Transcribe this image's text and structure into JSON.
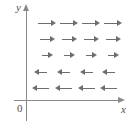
{
  "figure": {
    "kind": "vector-field-diagram",
    "background_color": "#ffffff",
    "axis_color": "#8a8a8a",
    "arrow_color": "#6e6e6e",
    "label_color": "#4d4d4d"
  },
  "axes": {
    "y_label": "y",
    "x_label": "x",
    "origin_label": "0",
    "y_axis": {
      "x": 26,
      "top": 4,
      "bottom": 121
    },
    "x_axis": {
      "y": 100,
      "left": 14,
      "right": 125
    }
  },
  "chart_data": {
    "type": "scatter",
    "title": "",
    "xlabel": "x",
    "ylabel": "y",
    "grid": false,
    "legend": "none",
    "rows": [
      {
        "row_index": 1,
        "y": 23,
        "direction": "right",
        "length": 18,
        "arrows": [
          {
            "x": 38,
            "y": 23,
            "direction": "right",
            "length": 18
          },
          {
            "x": 60,
            "y": 23,
            "direction": "right",
            "length": 18
          },
          {
            "x": 82,
            "y": 23,
            "direction": "right",
            "length": 18
          },
          {
            "x": 104,
            "y": 23,
            "direction": "right",
            "length": 18
          }
        ]
      },
      {
        "row_index": 2,
        "y": 39,
        "direction": "right",
        "length": 15,
        "arrows": [
          {
            "x": 40,
            "y": 39,
            "direction": "right",
            "length": 15
          },
          {
            "x": 62,
            "y": 39,
            "direction": "right",
            "length": 15
          },
          {
            "x": 84,
            "y": 39,
            "direction": "right",
            "length": 15
          },
          {
            "x": 106,
            "y": 39,
            "direction": "right",
            "length": 15
          }
        ]
      },
      {
        "row_index": 3,
        "y": 55,
        "direction": "right",
        "length": 11,
        "arrows": [
          {
            "x": 42,
            "y": 55,
            "direction": "right",
            "length": 11
          },
          {
            "x": 64,
            "y": 55,
            "direction": "right",
            "length": 11
          },
          {
            "x": 86,
            "y": 55,
            "direction": "right",
            "length": 11
          },
          {
            "x": 108,
            "y": 55,
            "direction": "right",
            "length": 11
          }
        ]
      },
      {
        "row_index": 4,
        "y": 72,
        "direction": "left",
        "length": 13,
        "arrows": [
          {
            "x": 34,
            "y": 72,
            "direction": "left",
            "length": 13
          },
          {
            "x": 57,
            "y": 72,
            "direction": "left",
            "length": 13
          },
          {
            "x": 80,
            "y": 72,
            "direction": "left",
            "length": 13
          },
          {
            "x": 102,
            "y": 72,
            "direction": "left",
            "length": 13
          }
        ]
      },
      {
        "row_index": 5,
        "y": 88,
        "direction": "left",
        "length": 17,
        "arrows": [
          {
            "x": 32,
            "y": 88,
            "direction": "left",
            "length": 17
          },
          {
            "x": 55,
            "y": 88,
            "direction": "left",
            "length": 17
          },
          {
            "x": 78,
            "y": 88,
            "direction": "left",
            "length": 17
          },
          {
            "x": 100,
            "y": 88,
            "direction": "left",
            "length": 17
          }
        ]
      }
    ]
  }
}
